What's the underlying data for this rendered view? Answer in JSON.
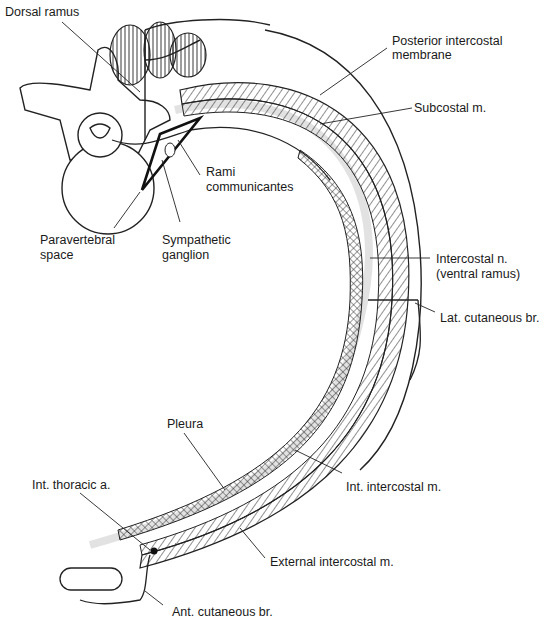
{
  "diagram": {
    "labels": {
      "dorsal_ramus": "Dorsal ramus",
      "posterior_intercostal_membrane_l1": "Posterior intercostal",
      "posterior_intercostal_membrane_l2": "membrane",
      "subcostal": "Subcostal m.",
      "rami_l1": "Rami",
      "rami_l2": "communicantes",
      "paravertebral_l1": "Paravertebral",
      "paravertebral_l2": "space",
      "sympathetic_l1": "Sympathetic",
      "sympathetic_l2": "ganglion",
      "intercostal_n_l1": "Intercostal n.",
      "intercostal_n_l2": "(ventral ramus)",
      "lat_cutaneous": "Lat. cutaneous br.",
      "pleura": "Pleura",
      "int_thoracic": "Int. thoracic a.",
      "int_intercostal": "Int. intercostal m.",
      "external_intercostal": "External intercostal m.",
      "ant_cutaneous": "Ant. cutaneous br."
    }
  }
}
